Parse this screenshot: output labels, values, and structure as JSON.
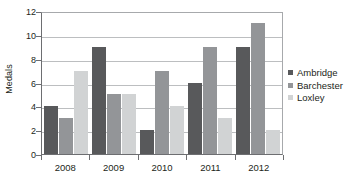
{
  "chart_data": {
    "type": "bar",
    "title": "",
    "xlabel": "",
    "ylabel": "Medals",
    "categories": [
      "2008",
      "2009",
      "2010",
      "2011",
      "2012"
    ],
    "series": [
      {
        "name": "Ambridge",
        "color": "#58595b",
        "values": [
          4,
          9,
          2,
          6,
          9
        ]
      },
      {
        "name": "Barchester",
        "color": "#939598",
        "values": [
          3,
          5,
          7,
          9,
          11
        ]
      },
      {
        "name": "Loxley",
        "color": "#d1d3d4",
        "values": [
          7,
          5,
          4,
          3,
          2
        ]
      }
    ],
    "ylim": [
      0,
      12
    ],
    "y_ticks": [
      0,
      2,
      4,
      6,
      8,
      10,
      12
    ],
    "grid": true,
    "legend_position": "right",
    "axis_color": "#6d6e71",
    "grid_color": "#bcbec0",
    "text_color": "#231f20",
    "background": "#ffffff"
  }
}
